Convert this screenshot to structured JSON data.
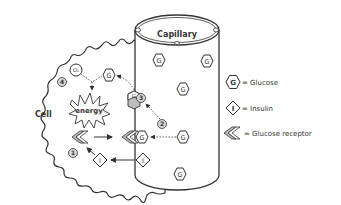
{
  "diagram": {
    "capillary_label": "Capillary",
    "cell_label": "Cell",
    "energy_label": "energy",
    "oxygen_label": "O₂",
    "glucose_symbol": "G",
    "insulin_symbol": "I",
    "steps": [
      "1",
      "2",
      "3",
      "4"
    ]
  },
  "legend": {
    "items": [
      {
        "symbol": "G",
        "shape": "hexagon",
        "label": "= Glucose"
      },
      {
        "symbol": "I",
        "shape": "diamond",
        "label": "= Insulin"
      },
      {
        "symbol": "",
        "shape": "chevron",
        "label": "= Glucose receptor"
      }
    ]
  },
  "colors": {
    "stroke": "#333333",
    "fill": "#ffffff",
    "step_fill": "#d6d6d6",
    "receptor_fill": "#bdbdbd"
  }
}
